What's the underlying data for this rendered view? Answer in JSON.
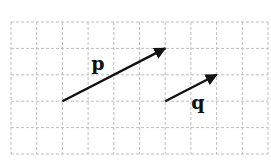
{
  "grid": {
    "columns": 10,
    "rows": 5,
    "origin_px": [
      11,
      22
    ],
    "cell_w": 25.7,
    "cell_h": 26.4,
    "line_color": "#bdbdbd"
  },
  "vectors": [
    {
      "name": "p",
      "label": "p",
      "tail": [
        2,
        3
      ],
      "head": [
        6,
        1
      ],
      "components": [
        4,
        2
      ],
      "label_pos_px": [
        98,
        70
      ]
    },
    {
      "name": "q",
      "label": "q",
      "tail": [
        6,
        3
      ],
      "head": [
        8,
        2
      ],
      "components": [
        2,
        1
      ],
      "label_pos_px": [
        198,
        109
      ]
    }
  ],
  "colors": {
    "vector": "#111111",
    "background": "#ffffff"
  }
}
